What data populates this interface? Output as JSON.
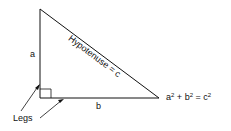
{
  "diagram": {
    "type": "right-triangle",
    "colors": {
      "line": "#111111",
      "background": "#ffffff"
    },
    "labels": {
      "side_a": "a",
      "side_b": "b",
      "hypotenuse": "Hypotenuse = c",
      "legs": "Legs",
      "formula": {
        "a": "a",
        "exp1": "2",
        "plus": " + ",
        "b": "b",
        "exp2": "2",
        "eq": " = ",
        "c": "c",
        "exp3": "2"
      }
    }
  }
}
